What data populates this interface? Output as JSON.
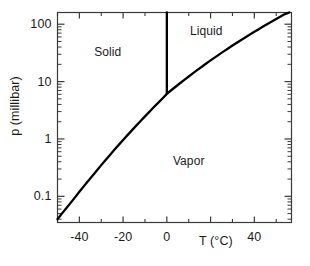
{
  "chart_data": {
    "type": "line",
    "title": "",
    "subtitle": "",
    "xlabel": "T (°C)",
    "ylabel": "p (millibar)",
    "xlim": [
      -50,
      57
    ],
    "ylim": [
      0.035,
      160
    ],
    "yscale": "log",
    "xscale": "linear",
    "grid": false,
    "legend": "none",
    "xticks": [
      -40,
      -20,
      0,
      40
    ],
    "xtick_labels": [
      "-40",
      "-20",
      "0",
      "40"
    ],
    "xticks_all_major": [
      -40,
      -20,
      0,
      20,
      40
    ],
    "yticks": [
      0.1,
      1,
      10,
      100
    ],
    "ytick_labels": [
      "0.1",
      "1",
      "10",
      "100"
    ],
    "annotations": [
      {
        "text": "Solid",
        "x": -27,
        "y": 33,
        "name": "solid-region-label"
      },
      {
        "text": "Liquid",
        "x": 18,
        "y": 75,
        "name": "liquid-region-label"
      },
      {
        "text": "Vapor",
        "x": 10,
        "y": 0.42,
        "name": "vapor-region-label"
      }
    ],
    "series": [
      {
        "name": "sublimation-vaporization-curve",
        "color": "#000000",
        "linewidth": 2.3,
        "points": [
          [
            -50.0,
            0.04
          ],
          [
            -48.0,
            0.05
          ],
          [
            -46.0,
            0.062
          ],
          [
            -44.0,
            0.077
          ],
          [
            -42.0,
            0.096
          ],
          [
            -40.0,
            0.12
          ],
          [
            -38.0,
            0.149
          ],
          [
            -36.0,
            0.185
          ],
          [
            -34.0,
            0.229
          ],
          [
            -32.0,
            0.283
          ],
          [
            -30.0,
            0.35
          ],
          [
            -28.0,
            0.43
          ],
          [
            -26.0,
            0.528
          ],
          [
            -24.0,
            0.646
          ],
          [
            -22.0,
            0.789
          ],
          [
            -20.0,
            0.96
          ],
          [
            -18.0,
            1.166
          ],
          [
            -16.0,
            1.412
          ],
          [
            -14.0,
            1.706
          ],
          [
            -12.0,
            2.057
          ],
          [
            -10.0,
            2.475
          ],
          [
            -8.0,
            2.971
          ],
          [
            -6.0,
            3.56
          ],
          [
            -4.0,
            4.257
          ],
          [
            -2.0,
            5.08
          ],
          [
            0.0,
            6.11
          ],
          [
            2.0,
            7.06
          ],
          [
            4.0,
            8.13
          ],
          [
            6.0,
            9.35
          ],
          [
            8.0,
            10.72
          ],
          [
            10.0,
            12.28
          ],
          [
            12.0,
            14.02
          ],
          [
            14.0,
            15.98
          ],
          [
            16.0,
            18.17
          ],
          [
            18.0,
            20.63
          ],
          [
            20.0,
            23.39
          ],
          [
            22.0,
            26.45
          ],
          [
            24.0,
            29.85
          ],
          [
            26.0,
            33.63
          ],
          [
            28.0,
            37.81
          ],
          [
            30.0,
            42.45
          ],
          [
            32.0,
            47.56
          ],
          [
            34.0,
            53.2
          ],
          [
            36.0,
            59.42
          ],
          [
            38.0,
            66.27
          ],
          [
            40.0,
            73.78
          ],
          [
            42.0,
            82.02
          ],
          [
            44.0,
            91.04
          ],
          [
            46.0,
            100.9
          ],
          [
            48.0,
            111.7
          ],
          [
            50.0,
            123.4
          ],
          [
            52.0,
            136.1
          ],
          [
            54.0,
            150.0
          ],
          [
            56.0,
            160.0
          ]
        ]
      },
      {
        "name": "melting-line",
        "color": "#000000",
        "linewidth": 2.3,
        "points": [
          [
            0.0,
            6.11
          ],
          [
            0.0,
            160.0
          ]
        ]
      }
    ],
    "triple_point": {
      "T": 0.0,
      "p": 6.11,
      "label": ""
    }
  },
  "axes": {
    "y_title": "p (millibar)",
    "x_title": "T (°C)",
    "x_title_parts": {
      "symbol": "T",
      "unit": "(°C)"
    }
  },
  "colors": {
    "curve": "#000000",
    "axis": "#3a3a3a",
    "text": "#1a1a1a",
    "background": "#ffffff"
  }
}
